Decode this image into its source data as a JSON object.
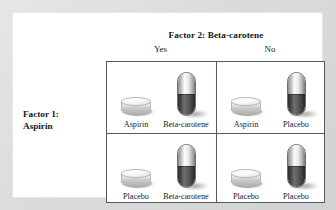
{
  "figure": {
    "column_factor_title": "Factor 2: Beta-carotene",
    "row_factor_title_line1": "Factor 1:",
    "row_factor_title_line2": "Aspirin",
    "column_headers": [
      "Yes",
      "No"
    ],
    "row_headers": [
      "Yes",
      "No"
    ],
    "cells": [
      {
        "position": "top-left",
        "row": "Yes",
        "column": "Yes",
        "treatments": [
          {
            "label": "Aspirin",
            "form": "tablet-icon"
          },
          {
            "label": "Beta-carotene",
            "form": "capsule-icon"
          }
        ]
      },
      {
        "position": "top-right",
        "row": "Yes",
        "column": "No",
        "treatments": [
          {
            "label": "Aspirin",
            "form": "tablet-icon"
          },
          {
            "label": "Placebo",
            "form": "capsule-icon"
          }
        ]
      },
      {
        "position": "bottom-left",
        "row": "No",
        "column": "Yes",
        "treatments": [
          {
            "label": "Placebo",
            "form": "tablet-icon"
          },
          {
            "label": "Beta-carotene",
            "form": "capsule-icon"
          }
        ]
      },
      {
        "position": "bottom-right",
        "row": "No",
        "column": "No",
        "treatments": [
          {
            "label": "Placebo",
            "form": "tablet-icon"
          },
          {
            "label": "Placebo",
            "form": "capsule-icon"
          }
        ]
      }
    ]
  },
  "colors": {
    "page_background": "#ffffff",
    "scan_margin": "#dcdcdc",
    "grid_line": "#555a60",
    "text": "#1b1b20",
    "capsule_dark": "#434343",
    "capsule_light": "#e8e8e8"
  }
}
